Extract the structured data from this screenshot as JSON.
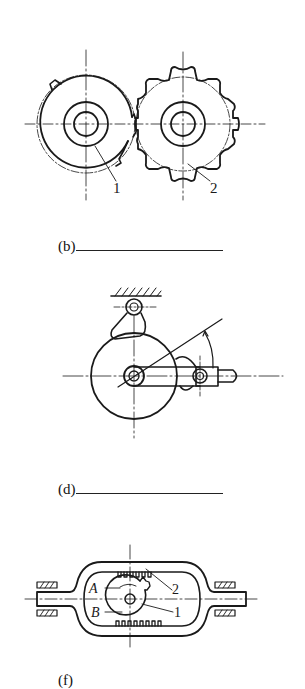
{
  "figures": [
    {
      "id": "b",
      "caption": "(b)",
      "answer_blank": "",
      "part_labels": [
        "1",
        "2"
      ],
      "description": "Intermittent gear pair: incomplete gear 1 engaging sprocket-like wheel 2"
    },
    {
      "id": "d",
      "caption": "(d)",
      "answer_blank": "",
      "part_labels": [],
      "description": "Cam disc with pivoted follower, sliding arm and angle arrow"
    },
    {
      "id": "f",
      "caption": "(f)",
      "answer_blank": "",
      "part_labels": [
        "A",
        "B",
        "1",
        "2"
      ],
      "description": "Rack frame with partial gear 1 and internal racks 2, slider bars both ends"
    }
  ],
  "colors": {
    "ink": "#1a1a1a",
    "background": "#ffffff"
  }
}
